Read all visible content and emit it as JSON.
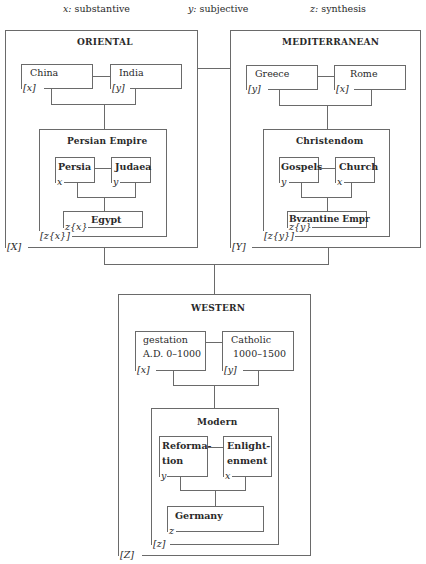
{
  "legend": {
    "x": {
      "key": "x:",
      "label": "substantive"
    },
    "y": {
      "key": "y:",
      "label": "subjective"
    },
    "z": {
      "key": "z:",
      "label": "synthesis"
    }
  },
  "oriental": {
    "title": "ORIENTAL",
    "label": "[X]",
    "china": {
      "name": "China",
      "tag": "[x]"
    },
    "india": {
      "name": "India",
      "tag": "[y]"
    },
    "persian_empire": {
      "title": "Persian Empire",
      "label": "[z{x}]",
      "persia": {
        "name": "Persia",
        "tag": "x"
      },
      "judaea": {
        "name": "Judaea",
        "tag": "y"
      },
      "egypt": {
        "name": "Egypt",
        "tag": "z{x}"
      }
    }
  },
  "mediterranean": {
    "title": "MEDITERRANEAN",
    "label": "[Y]",
    "greece": {
      "name": "Greece",
      "tag": "[y]"
    },
    "rome": {
      "name": "Rome",
      "tag": "[x]"
    },
    "christendom": {
      "title": "Christendom",
      "label": "[z{y}]",
      "gospels": {
        "name": "Gospels",
        "tag": "y"
      },
      "church": {
        "name": "Church",
        "tag": "x"
      },
      "byzantine": {
        "name": "Byzantine Empr",
        "tag": "z{y}"
      }
    }
  },
  "western": {
    "title": "WESTERN",
    "label": "[Z]",
    "gestation": {
      "line1": "gestation",
      "line2": "A.D. 0–1000",
      "tag": "[x]"
    },
    "catholic": {
      "line1": "Catholic",
      "line2": "1000–1500",
      "tag": "[y]"
    },
    "modern": {
      "title": "Modern",
      "label": "[z]",
      "reformation": {
        "line1": "Reforma-",
        "line2": "tion",
        "tag": "y"
      },
      "enlightenment": {
        "line1": "Enlight-",
        "line2": "enment",
        "tag": "x"
      },
      "germany": {
        "name": "Germany",
        "tag": "z"
      }
    }
  }
}
